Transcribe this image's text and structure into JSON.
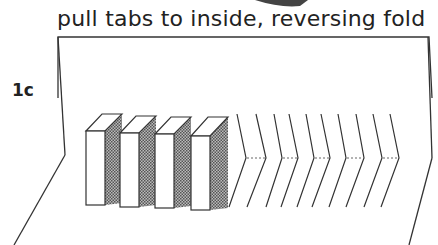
{
  "caption": "pull tabs to inside, reversing fold",
  "step_label": "1c",
  "figure": {
    "raised_tabs": 4,
    "folded_chevrons": 5,
    "colors": {
      "line": "#333333",
      "shade": "#888888",
      "background": "#ffffff"
    }
  }
}
